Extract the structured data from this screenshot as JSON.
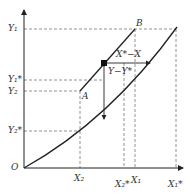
{
  "diagram": {
    "origin_label": "O",
    "y_ticks": [
      {
        "label": "Y1",
        "display": "Y₁",
        "y": 29
      },
      {
        "label": "Y1*",
        "display": "Y₁*",
        "y": 80
      },
      {
        "label": "Y2",
        "display": "Y₂",
        "y": 91
      },
      {
        "label": "Y2*",
        "display": "Y₂*",
        "y": 131
      }
    ],
    "x_ticks": [
      {
        "label": "X2",
        "display": "X₂",
        "x": 80
      },
      {
        "label": "X2*",
        "display": "X₂*",
        "x": 124
      },
      {
        "label": "X1",
        "display": "X₁",
        "x": 135
      },
      {
        "label": "X1*",
        "display": "X₁*",
        "x": 176
      }
    ],
    "point_labels": {
      "A": "A",
      "B": "B"
    },
    "horizontal_driving_force": "X*−X",
    "vertical_driving_force": "Y−Y*",
    "line_color": "#222222",
    "dash_color": "#777777"
  }
}
